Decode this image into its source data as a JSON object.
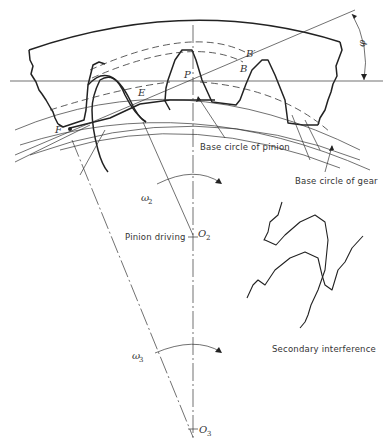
{
  "figure": {
    "labels": {
      "B_prime": "B′",
      "B": "B",
      "P": "P",
      "E": "E",
      "F": "F",
      "phi": "φ",
      "omega2": "ω",
      "omega2_sub": "2",
      "omega3": "ω",
      "omega3_sub": "3",
      "O2": "O",
      "O2_sub": "2",
      "O3": "O",
      "O3_sub": "3"
    },
    "annotations": {
      "base_circle_pinion": "Base circle of pinion",
      "base_circle_gear": "Base circle of gear",
      "pinion_driving": "Pinion driving",
      "secondary_interference": "Secondary interference"
    },
    "colors": {
      "line": "#222222",
      "background": "#ffffff"
    }
  }
}
